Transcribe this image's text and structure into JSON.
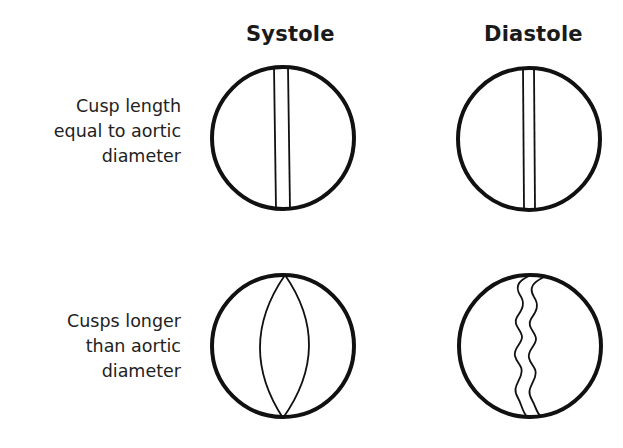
{
  "columns": [
    {
      "title": "Systole"
    },
    {
      "title": "Diastole"
    }
  ],
  "rows": [
    {
      "label_lines": [
        "Cusp length",
        "equal to aortic",
        "diameter"
      ]
    },
    {
      "label_lines": [
        "Cusps longer",
        "than aortic",
        "diameter"
      ]
    }
  ],
  "panels": [
    {
      "row": 0,
      "col": 0,
      "state": "systole",
      "cusp_shape": "straight-parallel-lines",
      "cx": 283,
      "cy": 138,
      "r": 72
    },
    {
      "row": 0,
      "col": 1,
      "state": "diastole",
      "cusp_shape": "straight-parallel-lines",
      "cx": 529,
      "cy": 139,
      "r": 72
    },
    {
      "row": 1,
      "col": 0,
      "state": "systole",
      "cusp_shape": "lens-shaped-arcs",
      "cx": 283,
      "cy": 347,
      "r": 72
    },
    {
      "row": 1,
      "col": 1,
      "state": "diastole",
      "cusp_shape": "wavy-parallel-lines",
      "cx": 530,
      "cy": 346,
      "r": 72
    }
  ],
  "colors": {
    "stroke": "#111111",
    "background": "#ffffff",
    "text": "#222222"
  }
}
